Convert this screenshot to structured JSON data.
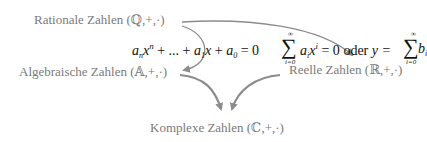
{
  "nodes": {
    "rational": "Rationale Zahlen (ℚ,+,·)",
    "algebraic": "Algebraische Zahlen (𝔸,+,·)",
    "real": "Reelle Zahlen (ℝ,+,·)",
    "complex": "Komplexe Zahlen (ℂ,+,·)"
  },
  "formulas": {
    "polynomial": {
      "a_n": "a",
      "n_sub": "n",
      "x1": "x",
      "n_sup": "n",
      "mid": " + ... + ",
      "a_1": "a",
      "one_sub": "1",
      "x2": "x",
      "plus": " + ",
      "a_0": "a",
      "zero_sub": "0",
      "eq": " = 0"
    },
    "series": {
      "sum1_upper": "∞",
      "sum1_lower": "i=0",
      "a_i": "a",
      "i_sub": "i",
      "x": "x",
      "i_sup": "i",
      "eq_zero": " = 0 ",
      "oder": "oder ",
      "y_eq": "y = ",
      "sum2_upper": "∞",
      "sum2_lower": "i=0",
      "b_i": "b",
      "bi_sub": "i"
    }
  },
  "colors": {
    "node_text": "#7a7a7a",
    "formula_text": "#111111",
    "arrow": "#8c8c8c"
  },
  "edges": [
    {
      "from": "rational",
      "to": "algebraic",
      "label": "polynomial"
    },
    {
      "from": "rational",
      "to": "real",
      "label": "series"
    },
    {
      "from": "algebraic",
      "to": "complex"
    },
    {
      "from": "real",
      "to": "complex"
    }
  ]
}
